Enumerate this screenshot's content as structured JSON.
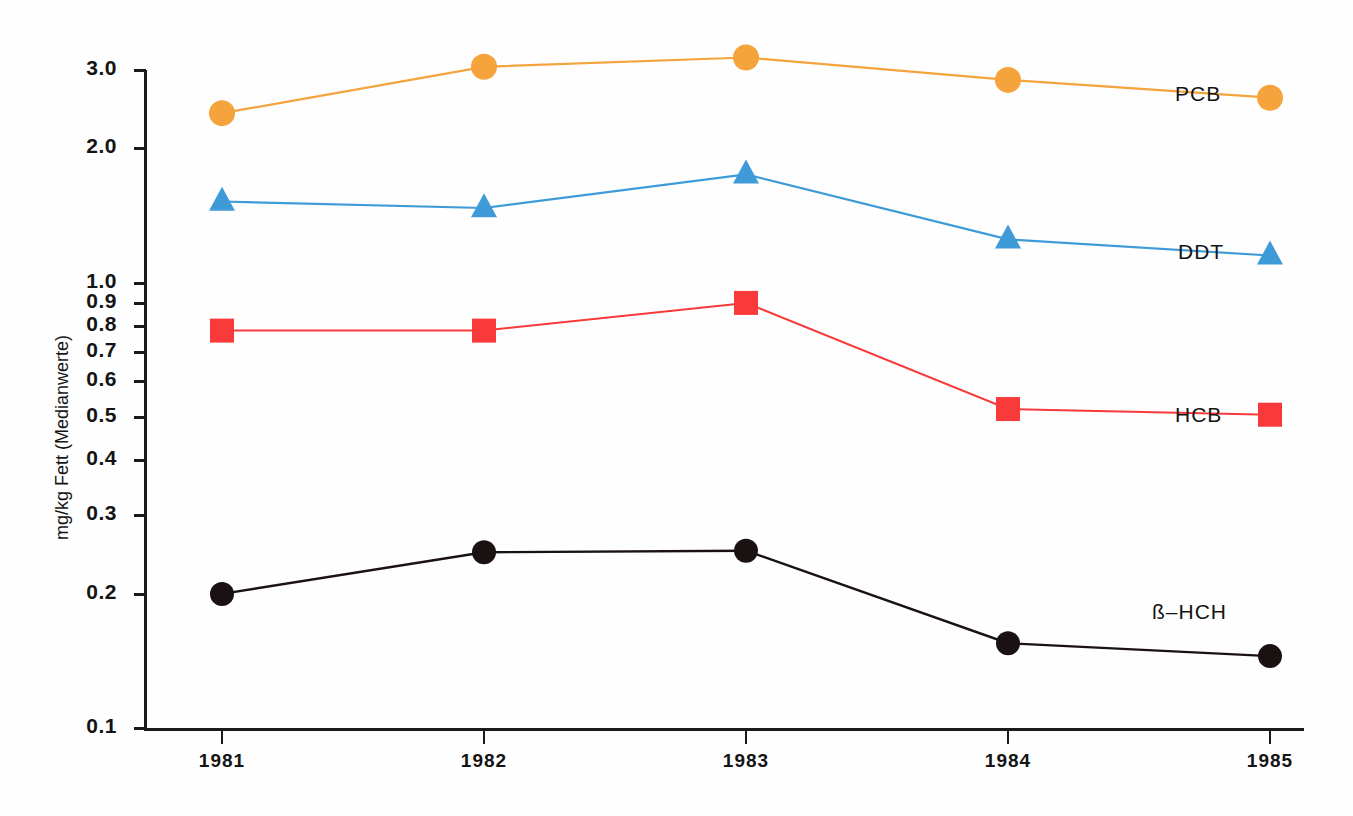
{
  "chart_data": {
    "type": "line",
    "title": "",
    "xlabel": "",
    "ylabel": "mg/kg Fett (Medianwerte)",
    "categories": [
      "1981",
      "1982",
      "1983",
      "1984",
      "1985"
    ],
    "x": [
      1981,
      1982,
      1983,
      1984,
      1985
    ],
    "yscale": "log",
    "ylim": [
      0.1,
      3.3
    ],
    "grid": false,
    "legend_position": "inline-right-of-last-point",
    "ytick_labels": [
      "3.0",
      "2.0",
      "1.0",
      "0.9",
      "0.8",
      "0.7",
      "0.6",
      "0.5",
      "0.4",
      "0.3",
      "0.2",
      "0.1"
    ],
    "ytick_values": [
      3.0,
      2.0,
      1.0,
      0.9,
      0.8,
      0.7,
      0.6,
      0.5,
      0.4,
      0.3,
      0.2,
      0.1
    ],
    "series": [
      {
        "name": "PCB",
        "marker": "circle",
        "color": "#F5A33C",
        "values": [
          2.4,
          3.05,
          3.2,
          2.85,
          2.6
        ]
      },
      {
        "name": "DDT",
        "marker": "triangle",
        "color": "#3E9BD8",
        "values": [
          1.52,
          1.47,
          1.75,
          1.25,
          1.15
        ]
      },
      {
        "name": "HCB",
        "marker": "square",
        "color": "#F93A3A",
        "values": [
          0.78,
          0.78,
          0.9,
          0.52,
          0.505
        ]
      },
      {
        "name": "ß–HCH",
        "marker": "circle",
        "color": "#1A1212",
        "values": [
          0.2,
          0.248,
          0.25,
          0.155,
          0.145
        ]
      }
    ]
  },
  "axis": {
    "y_title": "mg/kg Fett (Medianwerte)"
  },
  "labels": {
    "pcb": "PCB",
    "ddt": "DDT",
    "hcb": "HCB",
    "bhch": "ß–HCH"
  }
}
